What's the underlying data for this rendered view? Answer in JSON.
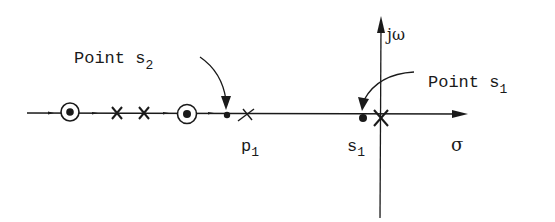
{
  "diagram": {
    "type": "s-plane root locus (real axis)",
    "axes": {
      "real_label": "σ",
      "imag_label": "jω"
    },
    "annotations": {
      "point_s2": {
        "text": "Point s",
        "sub": "2"
      },
      "point_s1": {
        "text": "Point s",
        "sub": "1"
      },
      "p1": {
        "text": "p",
        "sub": "1"
      },
      "s1": {
        "text": "s",
        "sub": "1"
      }
    },
    "markers": [
      {
        "kind": "zero-with-dot",
        "x": 70
      },
      {
        "kind": "pole",
        "x": 117
      },
      {
        "kind": "pole",
        "x": 144
      },
      {
        "kind": "zero-with-dot",
        "x": 187
      },
      {
        "kind": "point",
        "name": "s2",
        "x": 227
      },
      {
        "kind": "pole",
        "name": "p1",
        "x": 247
      },
      {
        "kind": "point",
        "name": "s1",
        "x": 363
      },
      {
        "kind": "pole",
        "name": "origin",
        "x": 381
      }
    ],
    "colors": {
      "ink": "#1a1a1a",
      "background": "#ffffff"
    }
  }
}
